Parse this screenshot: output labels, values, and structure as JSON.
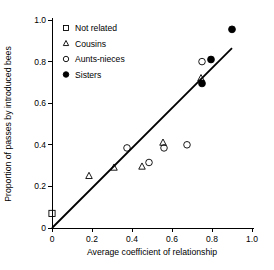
{
  "chart_data": {
    "type": "scatter",
    "title": "",
    "xlabel": "Average coefficient of relationship",
    "ylabel": "Proportion of passes by introduced bees",
    "xlim": [
      0,
      1.0
    ],
    "ylim": [
      0,
      1.0
    ],
    "grid": false,
    "xticks": [
      "0",
      "0.2",
      "0.4",
      "0.6",
      "0.8",
      "1.0"
    ],
    "xtick_values": [
      0,
      0.2,
      0.4,
      0.6,
      0.8,
      1.0
    ],
    "yticks": [
      "0",
      "0.2",
      "0.4",
      "0.6",
      "0.8",
      "1.0"
    ],
    "ytick_values": [
      0,
      0.2,
      0.4,
      0.6,
      0.8,
      1.0
    ],
    "legend_position": "top-left",
    "series": [
      {
        "name": "Not related",
        "marker": "open-square",
        "points": [
          [
            0.0,
            0.07
          ]
        ]
      },
      {
        "name": "Cousins",
        "marker": "open-triangle",
        "points": [
          [
            0.185,
            0.25
          ],
          [
            0.31,
            0.29
          ],
          [
            0.45,
            0.295
          ],
          [
            0.555,
            0.41
          ],
          [
            0.745,
            0.72
          ]
        ]
      },
      {
        "name": "Aunts-nieces",
        "marker": "open-circle",
        "points": [
          [
            0.375,
            0.385
          ],
          [
            0.485,
            0.315
          ],
          [
            0.56,
            0.385
          ],
          [
            0.675,
            0.4
          ],
          [
            0.75,
            0.8
          ]
        ]
      },
      {
        "name": "Sisters",
        "marker": "filled-circle",
        "points": [
          [
            0.75,
            0.695
          ],
          [
            0.795,
            0.81
          ],
          [
            0.9,
            0.955
          ]
        ]
      }
    ],
    "fit_line": {
      "name": "regression-line",
      "x_start": 0.0,
      "y_start": 0.0,
      "x_end": 0.9,
      "y_end": 0.865
    }
  }
}
